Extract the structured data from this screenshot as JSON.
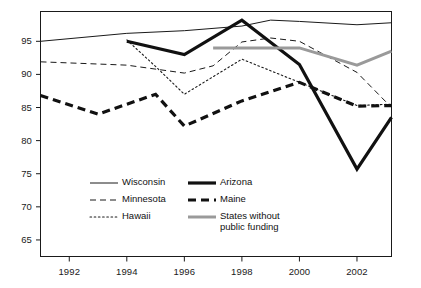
{
  "chart_data": {
    "type": "line",
    "title": "",
    "xlabel": "",
    "ylabel": "",
    "xlim": [
      1991,
      1903
    ],
    "x_axis": {
      "min": 1991,
      "max": 2003.2,
      "ticks": [
        1992,
        1994,
        1996,
        1998,
        2000,
        2002
      ],
      "tick_labels": [
        "1992",
        "1994",
        "1996",
        "1998",
        "2000",
        "2002"
      ]
    },
    "y_axis": {
      "min": 62.5,
      "max": 99.5,
      "ticks": [
        65,
        70,
        75,
        80,
        85,
        90,
        95
      ],
      "tick_labels": [
        "65",
        "70",
        "75",
        "80",
        "85",
        "90",
        "95"
      ]
    },
    "grid": false,
    "legend_position": "inside-bottom-left",
    "series": [
      {
        "name": "Wisconsin",
        "style": "solid-thin",
        "color": "#1a1a1a",
        "x": [
          1991,
          1994,
          1996,
          1998,
          1999,
          2000,
          2002,
          2003.2
        ],
        "values": [
          95.0,
          96.2,
          96.6,
          97.3,
          98.2,
          98.0,
          97.5,
          97.8
        ]
      },
      {
        "name": "Minnesota",
        "style": "dashed-thin",
        "color": "#1a1a1a",
        "x": [
          1991,
          1994,
          1996,
          1997,
          1998,
          1999,
          2000,
          2002,
          2003.2
        ],
        "values": [
          91.9,
          91.4,
          90.2,
          91.3,
          94.9,
          95.5,
          95.0,
          90.3,
          85.0
        ]
      },
      {
        "name": "Hawaii",
        "style": "dotted-thin",
        "color": "#1a1a1a",
        "x": [
          1994,
          1995,
          1996,
          1998,
          2000,
          2002,
          2003.2
        ],
        "values": [
          95.2,
          91.2,
          87.0,
          92.3,
          88.8,
          85.3,
          85.5
        ]
      },
      {
        "name": "Arizona",
        "style": "solid-thick",
        "color": "#111111",
        "x": [
          1994,
          1996,
          1998,
          2000,
          2002,
          2003.2
        ],
        "values": [
          95.0,
          93.0,
          98.2,
          91.5,
          75.7,
          83.5
        ]
      },
      {
        "name": "Maine",
        "style": "dashed-thick",
        "color": "#111111",
        "x": [
          1991,
          1993,
          1995,
          1996,
          1998,
          2000,
          2002,
          2003.2
        ],
        "values": [
          86.8,
          84.0,
          87.0,
          82.2,
          86.0,
          88.8,
          85.2,
          85.3
        ]
      },
      {
        "name": "States without public funding",
        "style": "solid-gray",
        "color": "#9a9a9a",
        "x": [
          1997,
          2000,
          2002,
          2003.2
        ],
        "values": [
          94.0,
          94.0,
          91.4,
          93.5
        ]
      }
    ]
  },
  "axes": {
    "y_tick_labels": [
      "95",
      "90",
      "85",
      "80",
      "75",
      "70",
      "65"
    ],
    "x_tick_labels": [
      "1992",
      "1994",
      "1996",
      "1998",
      "2000",
      "2002"
    ]
  },
  "legend": {
    "entries": [
      {
        "label": "Wisconsin",
        "style": "solid-thin",
        "color": "#1a1a1a"
      },
      {
        "label": "Minnesota",
        "style": "dashed-thin",
        "color": "#1a1a1a"
      },
      {
        "label": "Hawaii",
        "style": "dotted-thin",
        "color": "#1a1a1a"
      },
      {
        "label": "Arizona",
        "style": "solid-thick",
        "color": "#111111"
      },
      {
        "label": "Maine",
        "style": "dashed-thick",
        "color": "#111111"
      },
      {
        "label": "States without\npublic funding",
        "style": "solid-gray",
        "color": "#9a9a9a"
      }
    ]
  },
  "colors": {
    "frame": "#1a1a1a",
    "gray_series": "#9a9a9a",
    "background": "#ffffff",
    "text": "#111111"
  }
}
